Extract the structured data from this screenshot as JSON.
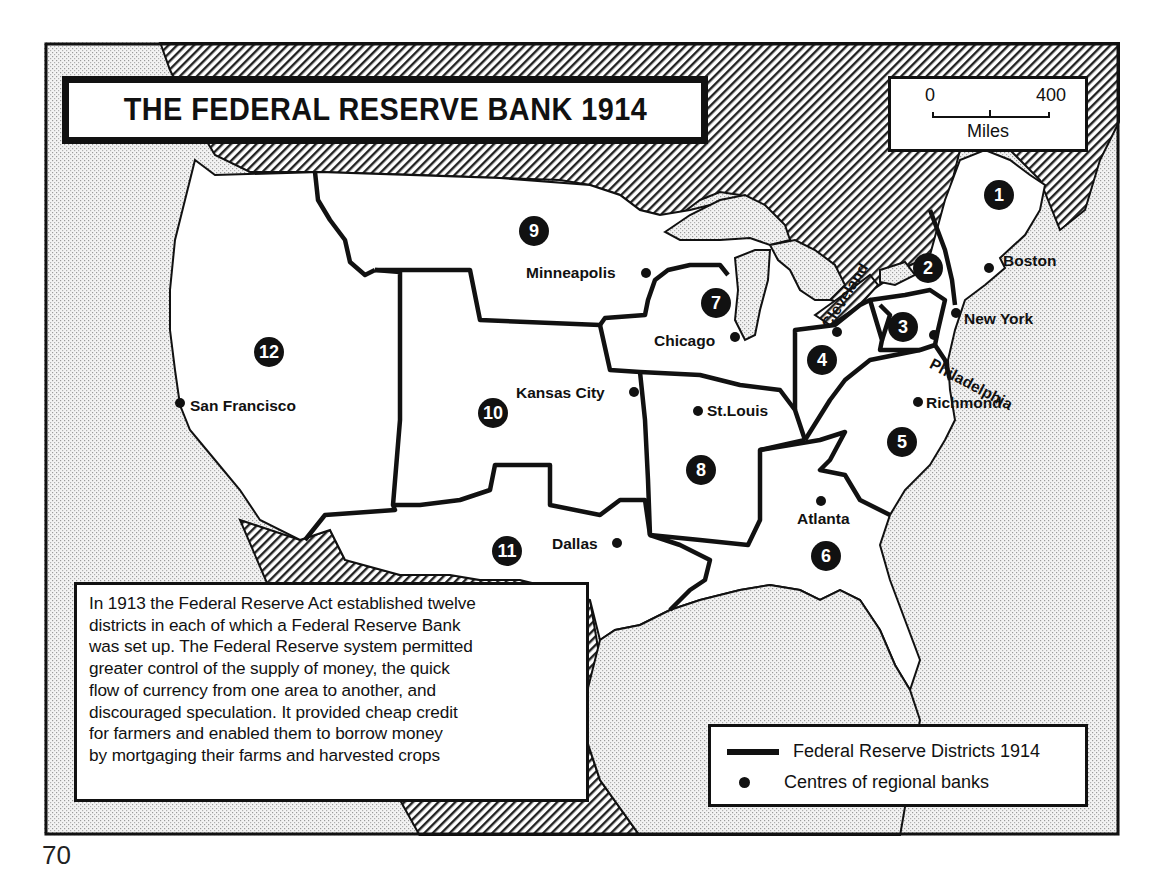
{
  "map": {
    "title": "THE FEDERAL RESERVE BANK 1914",
    "scale": {
      "start": "0",
      "end": "400",
      "unit": "Miles"
    },
    "description": "In 1913 the Federal Reserve Act established twelve districts in each of which a Federal Reserve Bank was set up. The Federal Reserve system permitted greater control of the supply of money, the quick flow of currency from one area to another, and discouraged speculation. It provided cheap credit for farmers and enabled them to borrow money by mortgaging their farms and harvested crops",
    "description_lines": [
      "In 1913 the  Federal Reserve Act established twelve",
      "districts  in each of which a  Federal  Reserve Bank",
      "was set up. The Federal Reserve system  permitted",
      "greater control of the supply of money, the quick",
      "flow of currency from one  area to another, and",
      "discouraged speculation. It provided cheap credit",
      "for farmers  and enabled  them to borrow  money",
      "by  mortgaging  their farms and harvested  crops"
    ],
    "legend": [
      {
        "symbol": "thick-line",
        "label": "Federal Reserve Districts 1914"
      },
      {
        "symbol": "dot",
        "label": "Centres of regional banks"
      }
    ],
    "districts": [
      {
        "number": "1",
        "city": "Boston"
      },
      {
        "number": "2",
        "city": "New York"
      },
      {
        "number": "3",
        "city": "Philadelphia"
      },
      {
        "number": "4",
        "city": "Cleveland"
      },
      {
        "number": "5",
        "city": "Richmond"
      },
      {
        "number": "6",
        "city": "Atlanta"
      },
      {
        "number": "7",
        "city": "Chicago"
      },
      {
        "number": "8",
        "city": "St.Louis"
      },
      {
        "number": "9",
        "city": "Minneapolis"
      },
      {
        "number": "10",
        "city": "Kansas City"
      },
      {
        "number": "11",
        "city": "Dallas"
      },
      {
        "number": "12",
        "city": "San Francisco"
      }
    ],
    "colors": {
      "ink": "#111111",
      "land": "#ffffff",
      "paper": "#ffffff"
    }
  },
  "page": {
    "number": "70"
  }
}
